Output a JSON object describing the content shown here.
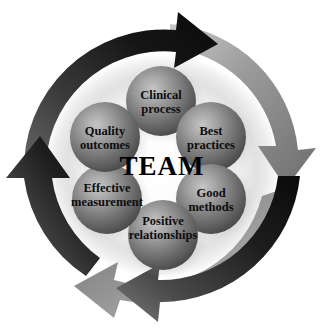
{
  "diagram": {
    "center_label": "TEAM",
    "background_color": "#ffffff",
    "arrow_dark_color": "#1a1a1a",
    "arrow_gray_color": "#8f8f8f",
    "sphere_color": "#6e6e6e",
    "sphere_highlight_color": "#b9b9b9",
    "sphere_shadow_color": "#3a3a3a",
    "label_color": "#0d0d0d",
    "nodes": [
      {
        "id": "clinical-process",
        "line1": "Clinical",
        "line2": "process"
      },
      {
        "id": "best-practices",
        "line1": "Best",
        "line2": "practices"
      },
      {
        "id": "good-methods",
        "line1": "Good",
        "line2": "methods"
      },
      {
        "id": "positive-relationships",
        "line1": "Positive",
        "line2": "relationships"
      },
      {
        "id": "effective-measurement",
        "line1": "Effective",
        "line2": "measurement"
      },
      {
        "id": "quality-outcomes",
        "line1": "Quality",
        "line2": "outcomes"
      }
    ],
    "arrows": [
      {
        "id": "arrow-dark-top",
        "color": "dark",
        "direction": "clockwise",
        "head_position": "top-right"
      },
      {
        "id": "arrow-dark-bottom",
        "color": "dark",
        "direction": "clockwise",
        "head_position": "bottom-left"
      },
      {
        "id": "arrow-gray-right",
        "color": "gray",
        "direction": "clockwise",
        "head_position": "right-lower"
      },
      {
        "id": "arrow-gray-left",
        "color": "gray",
        "direction": "clockwise",
        "head_position": "left-upper"
      }
    ]
  }
}
